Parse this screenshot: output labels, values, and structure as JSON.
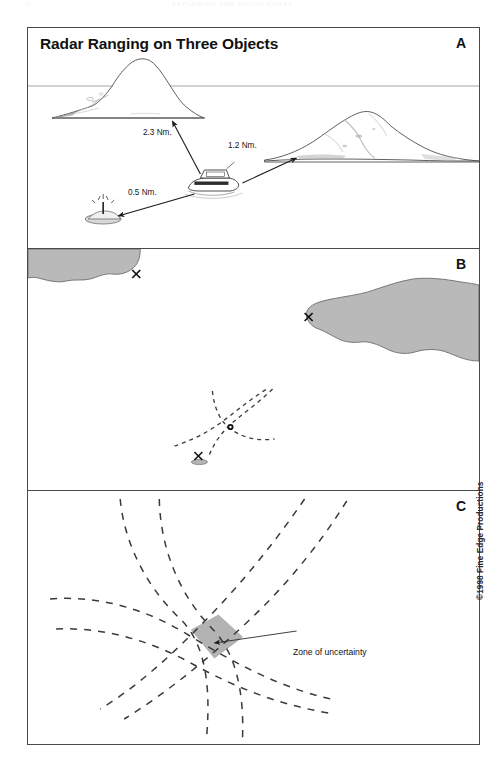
{
  "running_header": {
    "folio": "76",
    "title": "EXPLORING THE SOUTH COAST"
  },
  "figure": {
    "title": "Radar Ranging on Three Objects",
    "copyright": "©1998 Fine Edge Productions",
    "panels": [
      {
        "letter": "A",
        "name": "panel-a",
        "caption_labels": [
          "2.3 Nm.",
          "1.2 Nm.",
          "0.5 Nm."
        ]
      },
      {
        "letter": "B",
        "name": "panel-b"
      },
      {
        "letter": "C",
        "name": "panel-c",
        "annotation": "Zone of uncertainty"
      }
    ]
  },
  "panel_a": {
    "range_to_left_island": "2.3 Nm.",
    "range_to_right_island": "1.2 Nm.",
    "range_to_rock": "0.5 Nm."
  },
  "panel_c": {
    "annotation": "Zone of uncertainty"
  },
  "colors": {
    "land_fill": "#b9b9b9",
    "land_stroke": "#6d6d6d",
    "frame": "#4a4a4a",
    "ink": "#1a1a1a",
    "zone_fill": "#b3b3b3"
  }
}
